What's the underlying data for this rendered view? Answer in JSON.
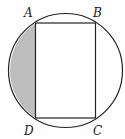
{
  "diagram": {
    "labels": {
      "A": "A",
      "B": "B",
      "C": "C",
      "D": "D"
    },
    "colors": {
      "stroke": "#222222",
      "shade": "#bdbdbd",
      "background": "#ffffff"
    },
    "shaded_region": "circular segment cut off by chord AD"
  }
}
